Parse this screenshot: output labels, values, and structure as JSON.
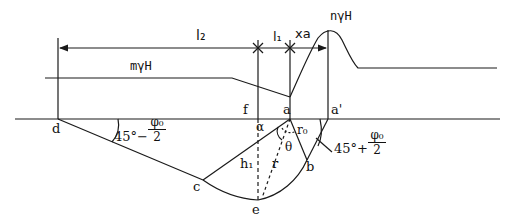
{
  "diagram": {
    "type": "geotechnical-failure-surface",
    "dimensions": {
      "l2": "l₂",
      "l1": "l₁",
      "xa": "xa"
    },
    "loads": {
      "left_surcharge": "mγH",
      "right_surcharge": "nγH"
    },
    "points": {
      "d": "d",
      "f": "f",
      "a": "a",
      "a_prime": "a'",
      "b": "b",
      "c": "c",
      "e": "e"
    },
    "angles": {
      "alpha": "α",
      "theta": "θ",
      "left_angle_prefix": "45°−",
      "left_angle_num": "φ₀",
      "left_angle_den": "2",
      "right_angle_prefix": "45°+",
      "right_angle_num": "φ₀",
      "right_angle_den": "2"
    },
    "lengths": {
      "h1": "h₁",
      "r": "r",
      "r0": "r₀"
    },
    "colors": {
      "line": "#1a1a1a",
      "background": "#ffffff"
    }
  }
}
